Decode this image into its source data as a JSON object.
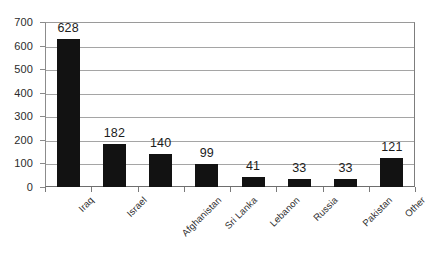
{
  "chart_data": {
    "type": "bar",
    "title": "",
    "subtitle": "",
    "xlabel": "",
    "ylabel": "",
    "categories": [
      "Iraq",
      "Israel",
      "Afghanistan",
      "Sri Lanka",
      "Lebanon",
      "Russia",
      "Pakistan",
      "Other"
    ],
    "values": [
      628,
      182,
      140,
      99,
      41,
      33,
      33,
      121
    ],
    "data_labels": [
      "628",
      "182",
      "140",
      "99",
      "41",
      "33",
      "33",
      "121"
    ],
    "ylim": [
      0,
      700
    ],
    "ytick_step": 100,
    "ytick_labels": [
      "0",
      "100",
      "200",
      "300",
      "400",
      "500",
      "600",
      "700"
    ],
    "grid": true,
    "grid_axis": "y",
    "legend": false,
    "legend_position": "none",
    "bar_color": "#121212",
    "grid_color": "#a5a5a5",
    "axis_color": "#7a7a7a",
    "background": "#ffffff"
  }
}
